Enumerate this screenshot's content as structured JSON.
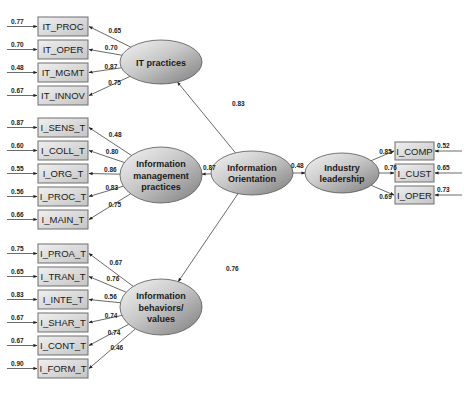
{
  "diagram": {
    "latents": [
      {
        "id": "IT",
        "lines": [
          "IT practices"
        ],
        "cx": 161,
        "cy": 62,
        "rx": 41,
        "ry": 22
      },
      {
        "id": "IMP",
        "lines": [
          "Information",
          "management",
          "practices"
        ],
        "cx": 161,
        "cy": 175,
        "rx": 41,
        "ry": 28
      },
      {
        "id": "IBV",
        "lines": [
          "Information",
          "behaviors/",
          "values"
        ],
        "cx": 161,
        "cy": 307,
        "rx": 41,
        "ry": 28
      },
      {
        "id": "IO",
        "lines": [
          "Information",
          "Orientation"
        ],
        "cx": 252,
        "cy": 173,
        "rx": 41,
        "ry": 22
      },
      {
        "id": "IL",
        "lines": [
          "Industry",
          "leadership"
        ],
        "cx": 342,
        "cy": 173,
        "rx": 37,
        "ry": 20
      }
    ],
    "indicators": [
      {
        "label": "IT_PROC",
        "latent": "IT",
        "x": 38,
        "y": 17,
        "w": 50,
        "h": 19,
        "loading": "0.65",
        "error": "0.77",
        "side": "left"
      },
      {
        "label": "IT_OPER",
        "latent": "IT",
        "x": 38,
        "y": 40,
        "w": 50,
        "h": 19,
        "loading": "0.70",
        "error": "0.70",
        "side": "left"
      },
      {
        "label": "IT_MGMT",
        "latent": "IT",
        "x": 38,
        "y": 63,
        "w": 50,
        "h": 19,
        "loading": "0.87",
        "error": "0.48",
        "side": "left"
      },
      {
        "label": "IT_INNOV",
        "latent": "IT",
        "x": 38,
        "y": 86,
        "w": 50,
        "h": 19,
        "loading": "0.75",
        "error": "0.67",
        "side": "left"
      },
      {
        "label": "I_SENS_T",
        "latent": "IMP",
        "x": 38,
        "y": 118,
        "w": 50,
        "h": 19,
        "loading": "0.48",
        "error": "0.87",
        "side": "left"
      },
      {
        "label": "I_COLL_T",
        "latent": "IMP",
        "x": 38,
        "y": 141,
        "w": 50,
        "h": 19,
        "loading": "0.80",
        "error": "0.60",
        "side": "left"
      },
      {
        "label": "I_ORG_T",
        "latent": "IMP",
        "x": 38,
        "y": 164,
        "w": 50,
        "h": 19,
        "loading": "0.86",
        "error": "0.55",
        "side": "left"
      },
      {
        "label": "I_PROC_T",
        "latent": "IMP",
        "x": 38,
        "y": 187,
        "w": 50,
        "h": 19,
        "loading": "0.83",
        "error": "0.56",
        "side": "left"
      },
      {
        "label": "I_MAIN_T",
        "latent": "IMP",
        "x": 38,
        "y": 210,
        "w": 50,
        "h": 19,
        "loading": "0.75",
        "error": "0.66",
        "side": "left"
      },
      {
        "label": "I_PROA_T",
        "latent": "IBV",
        "x": 38,
        "y": 244,
        "w": 50,
        "h": 19,
        "loading": "0.67",
        "error": "0.75",
        "side": "left"
      },
      {
        "label": "I_TRAN_T",
        "latent": "IBV",
        "x": 38,
        "y": 267,
        "w": 50,
        "h": 19,
        "loading": "0.76",
        "error": "0.65",
        "side": "left"
      },
      {
        "label": "I_INTE_T",
        "latent": "IBV",
        "x": 38,
        "y": 290,
        "w": 50,
        "h": 19,
        "loading": "0.56",
        "error": "0.83",
        "side": "left"
      },
      {
        "label": "I_SHAR_T",
        "latent": "IBV",
        "x": 38,
        "y": 313,
        "w": 50,
        "h": 19,
        "loading": "0.74",
        "error": "0.67",
        "side": "left"
      },
      {
        "label": "I_CONT_T",
        "latent": "IBV",
        "x": 38,
        "y": 336,
        "w": 50,
        "h": 19,
        "loading": "0.74",
        "error": "0.67",
        "side": "left"
      },
      {
        "label": "I_FORM_T",
        "latent": "IBV",
        "x": 38,
        "y": 359,
        "w": 50,
        "h": 19,
        "loading": "0.46",
        "error": "0.90",
        "side": "left"
      },
      {
        "label": "I_COMP",
        "latent": "IL",
        "x": 395,
        "y": 142,
        "w": 39,
        "h": 18,
        "loading": "0.85",
        "error": "0.52",
        "side": "right"
      },
      {
        "label": "I_CUST",
        "latent": "IL",
        "x": 395,
        "y": 164,
        "w": 39,
        "h": 18,
        "loading": "0.76",
        "error": "0.65",
        "side": "right"
      },
      {
        "label": "I_OPER",
        "latent": "IL",
        "x": 395,
        "y": 186,
        "w": 39,
        "h": 18,
        "loading": "0.69",
        "error": "0.73",
        "side": "right"
      }
    ],
    "paths": [
      {
        "from": "IO",
        "to": "IT",
        "coef": "0.83",
        "lx": 232,
        "ly": 106
      },
      {
        "from": "IO",
        "to": "IMP",
        "coef": "0.87",
        "lx": 203,
        "ly": 170
      },
      {
        "from": "IO",
        "to": "IBV",
        "coef": "0.76",
        "lx": 226,
        "ly": 271
      },
      {
        "from": "IO",
        "to": "IL",
        "coef": "0.48",
        "lx": 291,
        "ly": 168
      }
    ]
  }
}
